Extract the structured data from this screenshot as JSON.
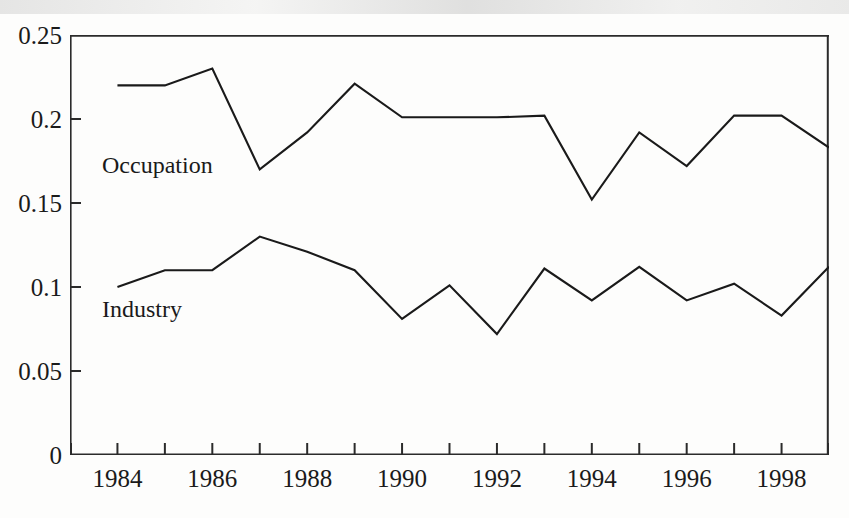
{
  "chart_data": {
    "type": "line",
    "title": "",
    "subtitle": "",
    "xlabel": "",
    "ylabel": "",
    "xlim": [
      1983,
      1999
    ],
    "ylim": [
      0,
      0.25
    ],
    "grid": false,
    "legend_position": "inline-annotations",
    "x": [
      1984,
      1985,
      1986,
      1987,
      1988,
      1989,
      1990,
      1991,
      1992,
      1993,
      1994,
      1995,
      1996,
      1997,
      1998,
      1999
    ],
    "xtick_labels": [
      "1984",
      "1986",
      "1988",
      "1990",
      "1992",
      "1994",
      "1996",
      "1998"
    ],
    "xtick_values": [
      1984,
      1986,
      1988,
      1990,
      1992,
      1994,
      1996,
      1998
    ],
    "xtick_minor_values": [
      1983,
      1985,
      1987,
      1989,
      1991,
      1993,
      1995,
      1997,
      1999
    ],
    "ytick_labels": [
      "0",
      "0.05",
      "0.1",
      "0.15",
      "0.2",
      "0.25"
    ],
    "ytick_values": [
      0,
      0.05,
      0.1,
      0.15,
      0.2,
      0.25
    ],
    "series": [
      {
        "name": "Occupation",
        "color": "#1a1a1a",
        "annotation_label": "Occupation",
        "values": [
          0.22,
          0.22,
          0.23,
          0.17,
          0.192,
          0.221,
          0.201,
          0.201,
          0.201,
          0.202,
          0.152,
          0.192,
          0.172,
          0.202,
          0.202,
          0.183
        ]
      },
      {
        "name": "Industry",
        "color": "#1a1a1a",
        "annotation_label": "Industry",
        "values": [
          0.1,
          0.11,
          0.11,
          0.13,
          0.121,
          0.11,
          0.081,
          0.101,
          0.072,
          0.111,
          0.092,
          0.112,
          0.092,
          0.102,
          0.083,
          0.112
        ]
      }
    ]
  },
  "annotations": {
    "occupation": "Occupation",
    "industry": "Industry"
  }
}
